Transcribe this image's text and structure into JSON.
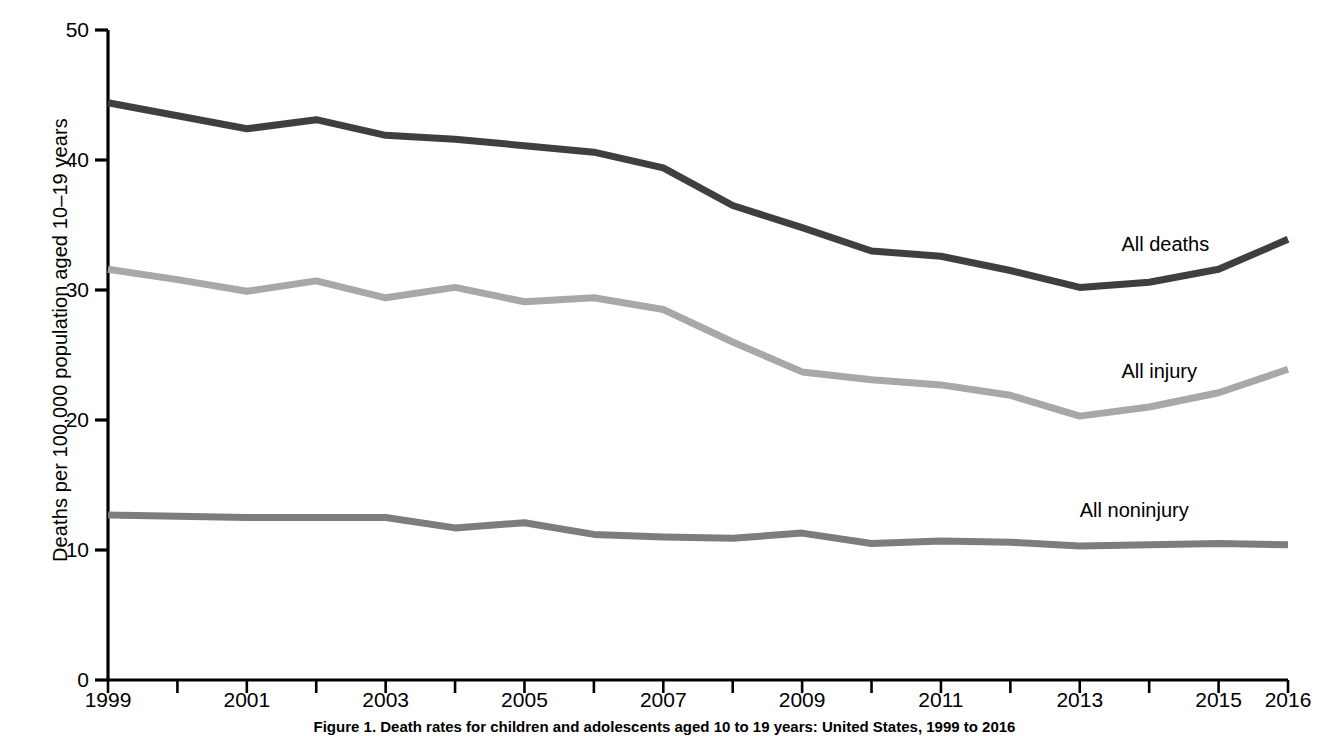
{
  "chart_data": {
    "type": "line",
    "title": "",
    "caption": "Figure 1. Death rates for children and adolescents aged 10 to 19 years: United States, 1999 to 2016",
    "xlabel": "",
    "ylabel": "Deaths per 100,000 population aged 10–19 years",
    "ylim": [
      0,
      50
    ],
    "xlim": [
      1999,
      2016
    ],
    "grid": false,
    "legend_position": "inline-right",
    "ytick_labels": [
      "0",
      "10",
      "20",
      "30",
      "40",
      "50"
    ],
    "ytick_values": [
      0,
      10,
      20,
      30,
      40,
      50
    ],
    "xtick_values": [
      1999,
      2000,
      2001,
      2002,
      2003,
      2004,
      2005,
      2006,
      2007,
      2008,
      2009,
      2010,
      2011,
      2012,
      2013,
      2014,
      2015,
      2016
    ],
    "xtick_labels": [
      "1999",
      "",
      "2001",
      "",
      "2003",
      "",
      "2005",
      "",
      "2007",
      "",
      "2009",
      "",
      "2011",
      "",
      "2013",
      "",
      "2015",
      "2016"
    ],
    "x": [
      1999,
      2000,
      2001,
      2002,
      2003,
      2004,
      2005,
      2006,
      2007,
      2008,
      2009,
      2010,
      2011,
      2012,
      2013,
      2014,
      2015,
      2016
    ],
    "series": [
      {
        "name": "All deaths",
        "color": "#3f3f3f",
        "label_x": 2013.6,
        "label_y": 33.4,
        "values": [
          44.4,
          43.4,
          42.4,
          43.1,
          41.9,
          41.6,
          41.1,
          40.6,
          39.4,
          36.5,
          34.8,
          33.0,
          32.6,
          31.5,
          30.2,
          30.6,
          31.6,
          33.9
        ]
      },
      {
        "name": "All injury",
        "color": "#a8a8a8",
        "label_x": 2013.6,
        "label_y": 23.6,
        "values": [
          31.6,
          30.8,
          29.9,
          30.7,
          29.4,
          30.2,
          29.1,
          29.4,
          28.5,
          26.0,
          23.7,
          23.1,
          22.7,
          21.9,
          20.3,
          21.0,
          22.1,
          23.9
        ]
      },
      {
        "name": "All noninjury",
        "color": "#7d7d7d",
        "label_x": 2013.0,
        "label_y": 12.9,
        "values": [
          12.7,
          12.6,
          12.5,
          12.5,
          12.5,
          11.7,
          12.1,
          11.2,
          11.0,
          10.9,
          11.3,
          10.5,
          10.7,
          10.6,
          10.3,
          10.4,
          10.5,
          10.4
        ]
      }
    ]
  },
  "axes": {
    "plot_left_px": 108,
    "plot_right_px": 1288,
    "plot_top_px": 30,
    "plot_bottom_px": 680
  }
}
